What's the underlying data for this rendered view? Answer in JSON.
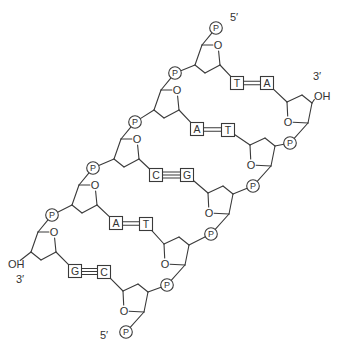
{
  "diagram": {
    "colors": {
      "line": "#3a3a3a",
      "text": "#333333",
      "background": "#ffffff"
    },
    "phosphate_label": "P",
    "ring_oxygen_label": "O",
    "hydroxyl_label": "OH",
    "left_strand": {
      "name": "left strand",
      "end_top_label": "5′",
      "end_bottom_label": "3′",
      "top_label_pos": [
        230,
        21
      ],
      "bottom_label_pos": [
        16,
        283
      ],
      "oh_pos": [
        8,
        268
      ],
      "phosphates": [
        [
          216,
          28
        ],
        [
          175,
          73
        ],
        [
          135,
          122
        ],
        [
          93,
          168
        ],
        [
          52,
          215
        ]
      ],
      "bases": [
        "T",
        "A",
        "C",
        "A",
        "G"
      ]
    },
    "right_strand": {
      "name": "right strand",
      "end_top_label": "3′",
      "end_bottom_label": "5′",
      "top_label_pos": [
        313,
        80
      ],
      "bottom_label_pos": [
        100,
        339
      ],
      "oh_pos": [
        314,
        100
      ],
      "phosphates": [
        [
          290,
          143
        ],
        [
          253,
          186
        ],
        [
          211,
          234
        ],
        [
          167,
          285
        ],
        [
          126,
          332
        ]
      ],
      "bases": [
        "A",
        "T",
        "G",
        "T",
        "C"
      ]
    },
    "base_pairs": [
      {
        "left": "T",
        "right": "A",
        "bonds": 2,
        "left_box": [
          237,
          83
        ],
        "right_box": [
          267,
          83
        ]
      },
      {
        "left": "A",
        "right": "T",
        "bonds": 2,
        "left_box": [
          197,
          129
        ],
        "right_box": [
          228,
          130
        ]
      },
      {
        "left": "C",
        "right": "G",
        "bonds": 3,
        "left_box": [
          156,
          175
        ],
        "right_box": [
          187,
          175
        ]
      },
      {
        "left": "A",
        "right": "T",
        "bonds": 2,
        "left_box": [
          116,
          223
        ],
        "right_box": [
          146,
          224
        ]
      },
      {
        "left": "G",
        "right": "C",
        "bonds": 3,
        "left_box": [
          75,
          271
        ],
        "right_box": [
          104,
          272
        ]
      }
    ]
  }
}
